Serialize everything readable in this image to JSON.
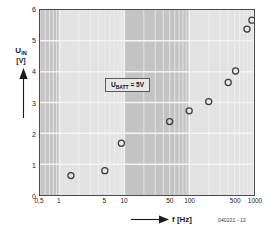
{
  "figure": {
    "code": "040221 - 12",
    "annotation": {
      "prefix": "U",
      "subscript": "BATT",
      "suffix": " = 5V"
    }
  },
  "axes": {
    "y_title_main": "U",
    "y_title_sub": "IN",
    "y_title_unit": "[V]",
    "x_title": "f  [Hz]",
    "y_tick_labels": [
      "0",
      "1",
      "2",
      "3",
      "4",
      "5",
      "6"
    ],
    "x_tick_labels": [
      "0,5",
      "1",
      "5",
      "10",
      "50",
      "100",
      "500",
      "1000"
    ]
  },
  "colors": {
    "band_light": "#e3e3e3",
    "band_dark": "#c4c4c4",
    "grid": "#f4f4f4",
    "frame": "#4a4a4a",
    "marker": "#3c3c3c",
    "text": "#1a1a1a"
  },
  "chart_data": {
    "type": "scatter",
    "title": "",
    "xlabel": "f [Hz]",
    "ylabel": "U_IN [V]",
    "xscale": "log",
    "yscale": "linear",
    "xlim": [
      0.5,
      1000
    ],
    "ylim": [
      0,
      6
    ],
    "xticks": [
      0.5,
      1,
      5,
      10,
      50,
      100,
      500,
      1000
    ],
    "xticklabels": [
      "0,5",
      "1",
      "5",
      "10",
      "50",
      "100",
      "500",
      "1000"
    ],
    "yticks": [
      0,
      1,
      2,
      3,
      4,
      5,
      6
    ],
    "yticklabels": [
      "0",
      "1",
      "2",
      "3",
      "4",
      "5",
      "6"
    ],
    "grid": true,
    "legend": null,
    "annotations": [
      {
        "text": "UBATT = 5V",
        "x": 22,
        "y": 4.35
      }
    ],
    "marker_style": "open-circle",
    "series": [
      {
        "name": "UIN vs f",
        "points": [
          {
            "x": 1.5,
            "y": 0.63
          },
          {
            "x": 5.0,
            "y": 0.79
          },
          {
            "x": 9.0,
            "y": 1.68
          },
          {
            "x": 50.0,
            "y": 2.38
          },
          {
            "x": 100.0,
            "y": 2.73
          },
          {
            "x": 200.0,
            "y": 3.03
          },
          {
            "x": 400.0,
            "y": 3.65
          },
          {
            "x": 520.0,
            "y": 4.02
          },
          {
            "x": 780.0,
            "y": 5.38
          },
          {
            "x": 930.0,
            "y": 5.67
          }
        ]
      }
    ]
  }
}
